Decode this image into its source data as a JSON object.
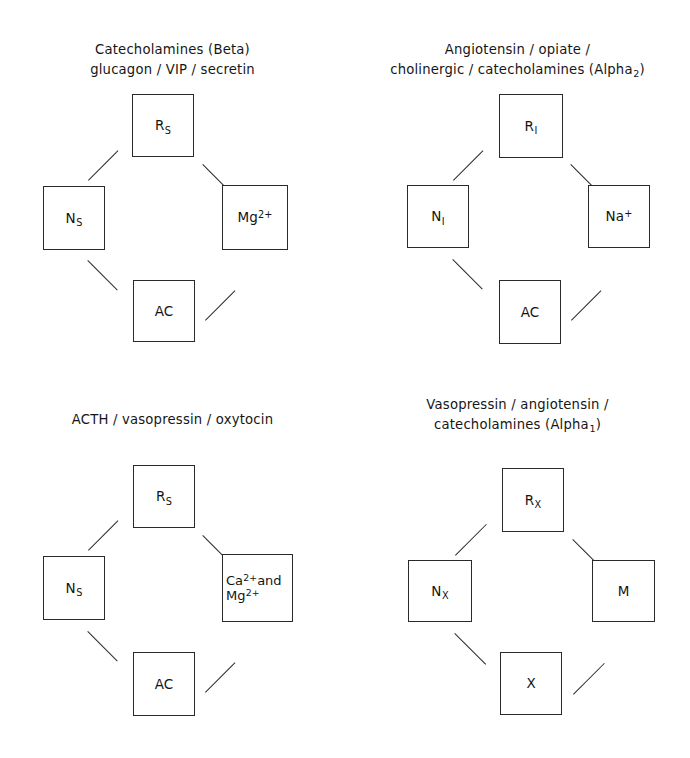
{
  "figure": {
    "background": "#ffffff",
    "line_color": "#2b2b2b",
    "text_color": "#141414"
  },
  "panels": [
    {
      "id": "panel-top-left",
      "title": "Catecholamines (Beta)\nglucagon / VIP / secretin",
      "nodes": {
        "top": "R<sub>S</sub>",
        "left": "N<sub>S</sub>",
        "right": "Mg<sup>2+</sup>",
        "bottom": "AC"
      }
    },
    {
      "id": "panel-top-right",
      "title": "Angiotensin / opiate /\ncholinergic / catecholamines (Alpha<sub>2</sub>)",
      "nodes": {
        "top": "R<sub>I</sub>",
        "left": "N<sub>I</sub>",
        "right": "Na<sup>+</sup>",
        "bottom": "AC"
      }
    },
    {
      "id": "panel-bottom-left",
      "title": "ACTH / vasopressin / oxytocin",
      "nodes": {
        "top": "R<sub>S</sub>",
        "left": "N<sub>S</sub>",
        "right": "Ca<sup>2+</sup>and<br>Mg<sup>2+</sup>",
        "bottom": "AC"
      }
    },
    {
      "id": "panel-bottom-right",
      "title": "Vasopressin / angiotensin /\ncatecholamines (Alpha<sub>1</sub>)",
      "nodes": {
        "top": "R<sub>X</sub>",
        "left": "N<sub>X</sub>",
        "right": "M",
        "bottom": "X"
      }
    }
  ]
}
